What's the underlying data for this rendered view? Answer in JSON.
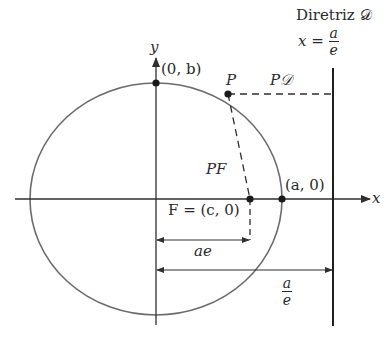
{
  "diagram": {
    "colors": {
      "ellipse": "#6b6b6b",
      "axes": "#2f2f2f",
      "text": "#2a2a2a",
      "background": "#ffffff"
    },
    "labels": {
      "directrix_title": "Diretriz 𝒟",
      "directrix_eq_lhs": "x =",
      "directrix_eq_num": "a",
      "directrix_eq_den": "e",
      "y_axis": "y",
      "x_axis": "x",
      "vertex_top": "(0, b)",
      "point_p": "P",
      "segment_pd": "P𝒟",
      "segment_pf": "PF",
      "vertex_right": "(a, 0)",
      "focus": "F = (c, 0)",
      "dist_ae": "ae",
      "dist_a_over_e_num": "a",
      "dist_a_over_e_den": "e"
    },
    "geometry": {
      "center": [
        156,
        199
      ],
      "rx": 126,
      "ry": 116,
      "focus": [
        250,
        199
      ],
      "point_p": [
        228,
        94
      ],
      "vertex_top": [
        156,
        83
      ],
      "vertex_right": [
        282,
        199
      ],
      "directrix_x": 333
    }
  }
}
